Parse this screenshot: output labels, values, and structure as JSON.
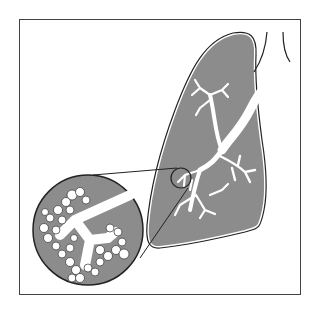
{
  "figure": {
    "colors": {
      "background": "#ffffff",
      "frame": "#444444",
      "lung_fill": "#8c8c8c",
      "outline": "#222222",
      "airway": "#ffffff"
    },
    "parts": [
      "lung",
      "trachea",
      "bronchial-tree",
      "magnifier-circle",
      "alveoli-inset"
    ]
  }
}
